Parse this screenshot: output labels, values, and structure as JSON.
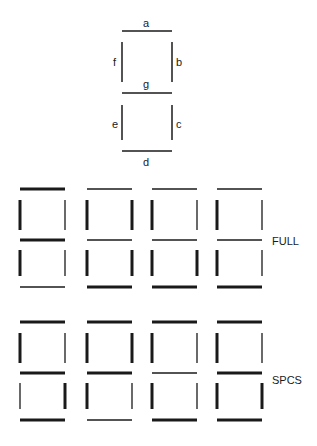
{
  "legend": {
    "segments": [
      {
        "id": "a",
        "label": "a"
      },
      {
        "id": "b",
        "label": "b"
      },
      {
        "id": "c",
        "label": "c"
      },
      {
        "id": "d",
        "label": "d"
      },
      {
        "id": "e",
        "label": "e"
      },
      {
        "id": "f",
        "label": "f"
      },
      {
        "id": "g",
        "label": "g"
      }
    ]
  },
  "rows": [
    {
      "label": "FULL",
      "digits": [
        {
          "a": "thick",
          "b": "thin",
          "c": "thin",
          "d": "thin",
          "e": "thick",
          "f": "thick",
          "g": "thick"
        },
        {
          "a": "thin",
          "b": "thick",
          "c": "thick",
          "d": "thick",
          "e": "thick",
          "f": "thick",
          "g": "thin"
        },
        {
          "a": "thin",
          "b": "thin",
          "c": "thick",
          "d": "thick",
          "e": "thick",
          "f": "thick",
          "g": "thin"
        },
        {
          "a": "thin",
          "b": "thin",
          "c": "thin",
          "d": "thick",
          "e": "thick",
          "f": "thick",
          "g": "thin"
        }
      ]
    },
    {
      "label": "SPCS",
      "digits": [
        {
          "a": "thick",
          "b": "thin",
          "c": "thick",
          "d": "thick",
          "e": "thin",
          "f": "thick",
          "g": "thick"
        },
        {
          "a": "thick",
          "b": "thick",
          "c": "thin",
          "d": "thin",
          "e": "thick",
          "f": "thick",
          "g": "thick"
        },
        {
          "a": "thick",
          "b": "thin",
          "c": "thin",
          "d": "thick",
          "e": "thick",
          "f": "thick",
          "g": "thin"
        },
        {
          "a": "thick",
          "b": "thin",
          "c": "thick",
          "d": "thick",
          "e": "thick",
          "f": "thick",
          "g": "thick"
        }
      ]
    }
  ],
  "colors": {
    "stroke": "#1a1a1a",
    "background": "#ffffff"
  }
}
